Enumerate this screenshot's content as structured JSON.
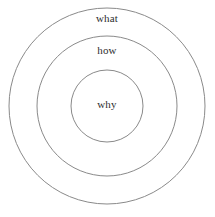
{
  "diagram": {
    "type": "concentric-circles",
    "title": "",
    "canvas": {
      "width": 215,
      "height": 217,
      "background": "#ffffff"
    },
    "style": {
      "stroke_color": "#8a8a8a",
      "stroke_width": 1,
      "fill": "none",
      "label_color": "#2e2e2e",
      "label_font_size": 11
    },
    "rings": [
      {
        "id": "outer",
        "label": "what",
        "center_x": 107,
        "center_y": 106,
        "radius": 98,
        "label_x": 107,
        "label_y": 19
      },
      {
        "id": "middle",
        "label": "how",
        "center_x": 107,
        "center_y": 106,
        "radius": 70,
        "label_x": 107,
        "label_y": 51
      },
      {
        "id": "inner",
        "label": "why",
        "center_x": 107,
        "center_y": 106,
        "radius": 36,
        "label_x": 107,
        "label_y": 105
      }
    ]
  }
}
